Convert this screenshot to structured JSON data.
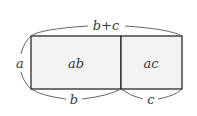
{
  "diagram": {
    "type": "area-model",
    "colors": {
      "stroke": "#2a2a2a",
      "fill": "#f3f3f3",
      "brace": "#555555",
      "text": "#3a3a3a"
    },
    "labels": {
      "top_brace": "b+c",
      "left_brace": "a",
      "bottom_left_brace": "b",
      "bottom_right_brace": "c",
      "region_left": "ab",
      "region_right": "ac"
    }
  }
}
